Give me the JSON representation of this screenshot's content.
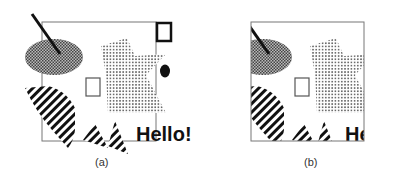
{
  "figure": {
    "panels": [
      {
        "id": "a",
        "caption": "(a)",
        "label": "unclipped scene with clip rectangle"
      },
      {
        "id": "b",
        "caption": "(b)",
        "label": "scene clipped to rectangle"
      }
    ],
    "text_object": "Hello!",
    "text_object_clipped": "He"
  },
  "colors": {
    "frame": "#777777",
    "ink": "#111111",
    "dots_dark": "#555555",
    "dots_light": "#777777"
  }
}
